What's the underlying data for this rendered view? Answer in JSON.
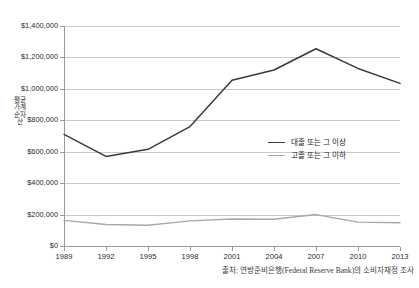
{
  "chart_data": {
    "type": "line",
    "title": "",
    "xlabel": "",
    "ylabel": "평균 가계순자산",
    "x": [
      1989,
      1992,
      1995,
      1998,
      2001,
      2004,
      2007,
      2010,
      2013
    ],
    "xtick_labels": [
      "1989",
      "1992",
      "1995",
      "1998",
      "2001",
      "2004",
      "2007",
      "2010",
      "2013"
    ],
    "ytick_labels": [
      "$0",
      "$200,000",
      "$400,000",
      "$600,000",
      "$800,000",
      "$1,000,000",
      "$1,200,000",
      "$1,400,000"
    ],
    "ytick_values": [
      0,
      200000,
      400000,
      600000,
      800000,
      1000000,
      1200000,
      1400000
    ],
    "ylim": [
      0,
      1400000
    ],
    "xlim": [
      1989,
      2013
    ],
    "grid": true,
    "legend_position": "center-right",
    "series": [
      {
        "name": "대졸 또는 그 이상",
        "color": "#3a3a3a",
        "values": [
          710000,
          570000,
          615000,
          760000,
          1055000,
          1120000,
          1255000,
          1130000,
          1035000
        ]
      },
      {
        "name": "고졸 또는 그 이하",
        "color": "#a8a8a8",
        "values": [
          163000,
          137000,
          132000,
          160000,
          172000,
          170000,
          200000,
          152000,
          148000
        ]
      }
    ],
    "source_note": "출처: 연방준비은행(Federal Reserve Bank)의 소비자재정 조사"
  },
  "axis": {
    "y_title": "평균 가계순자산"
  },
  "legend": {
    "items": [
      {
        "label": "대졸 또는 그 이상",
        "color": "#3a3a3a"
      },
      {
        "label": "고졸 또는 그 이하",
        "color": "#a8a8a8"
      }
    ]
  },
  "caption": {
    "text": "출처: 연방준비은행(Federal Reserve Bank)의 소비자재정 조사"
  },
  "colors": {
    "grid": "#c9c9c9",
    "axis": "#9a9a9a",
    "series_high": "#3a3a3a",
    "series_low": "#a8a8a8",
    "background": "#ffffff"
  }
}
